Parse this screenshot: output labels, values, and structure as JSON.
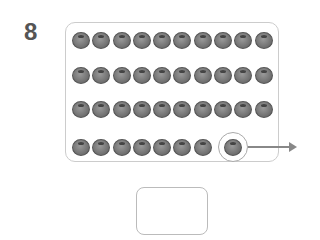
{
  "problem": {
    "number": "8",
    "rows": [
      10,
      10,
      10,
      7
    ],
    "circled_count": 1,
    "total_items": 38,
    "item_icon": "blueberry-icon",
    "answer_value": ""
  }
}
